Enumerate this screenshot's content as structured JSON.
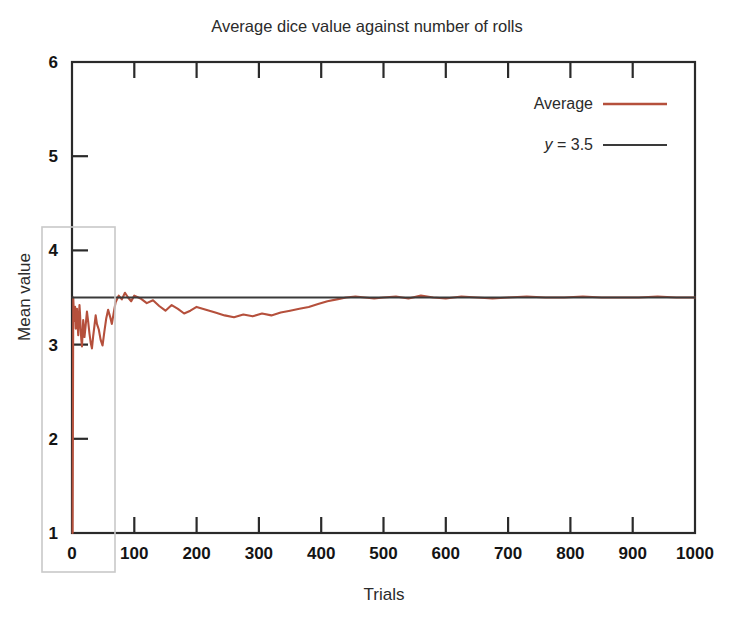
{
  "chart_data": {
    "type": "line",
    "title": "Average dice value against number of rolls",
    "xlabel": "Trials",
    "ylabel": "Mean value",
    "xlim": [
      0,
      1000
    ],
    "ylim": [
      1,
      6
    ],
    "xticks": [
      0,
      100,
      200,
      300,
      400,
      500,
      600,
      700,
      800,
      900,
      1000
    ],
    "xtick_labels": [
      "0",
      "100",
      "200",
      "300",
      "400",
      "500",
      "600",
      "700",
      "800",
      "900",
      "1000"
    ],
    "yticks": [
      1,
      2,
      3,
      4,
      5,
      6
    ],
    "ytick_labels": [
      "1",
      "2",
      "3",
      "4",
      "5",
      "6"
    ],
    "grid": false,
    "legend_position": "top-right",
    "series": [
      {
        "name": "Average",
        "kind": "line",
        "color": "#b5503c",
        "x": [
          1,
          2,
          3,
          4,
          5,
          6,
          7,
          8,
          9,
          10,
          11,
          12,
          13,
          14,
          15,
          16,
          17,
          18,
          19,
          20,
          22,
          24,
          26,
          28,
          30,
          32,
          34,
          36,
          38,
          40,
          43,
          46,
          49,
          52,
          55,
          58,
          61,
          64,
          67,
          70,
          75,
          80,
          85,
          90,
          95,
          100,
          110,
          120,
          130,
          140,
          150,
          160,
          170,
          180,
          190,
          200,
          215,
          230,
          245,
          260,
          275,
          290,
          305,
          320,
          335,
          350,
          365,
          380,
          395,
          410,
          425,
          440,
          455,
          470,
          485,
          500,
          520,
          540,
          560,
          580,
          600,
          625,
          650,
          675,
          700,
          730,
          760,
          790,
          820,
          850,
          880,
          910,
          940,
          970,
          1000
        ],
        "y": [
          1.0,
          3.5,
          3.33,
          3.25,
          3.4,
          3.17,
          3.29,
          3.38,
          3.22,
          3.1,
          3.27,
          3.42,
          3.31,
          3.15,
          3.05,
          2.98,
          3.12,
          3.26,
          3.18,
          3.08,
          3.21,
          3.35,
          3.24,
          3.12,
          3.02,
          2.96,
          3.09,
          3.2,
          3.31,
          3.22,
          3.16,
          3.05,
          2.99,
          3.14,
          3.28,
          3.37,
          3.3,
          3.22,
          3.34,
          3.45,
          3.52,
          3.48,
          3.55,
          3.5,
          3.46,
          3.52,
          3.49,
          3.44,
          3.47,
          3.41,
          3.36,
          3.42,
          3.38,
          3.33,
          3.36,
          3.4,
          3.37,
          3.34,
          3.31,
          3.29,
          3.32,
          3.3,
          3.33,
          3.31,
          3.34,
          3.36,
          3.38,
          3.4,
          3.43,
          3.46,
          3.48,
          3.5,
          3.51,
          3.5,
          3.49,
          3.5,
          3.51,
          3.49,
          3.52,
          3.5,
          3.49,
          3.51,
          3.5,
          3.49,
          3.5,
          3.51,
          3.5,
          3.5,
          3.51,
          3.5,
          3.5,
          3.5,
          3.51,
          3.5,
          3.5
        ]
      },
      {
        "name": "y = 3.5",
        "kind": "reference-line",
        "color": "#3a3a3a",
        "value": 3.5
      }
    ],
    "annotations": [
      {
        "name": "early-trials-highlight-box",
        "kind": "rectangle",
        "color": "#c9c9c9",
        "description": "highlight box around early trials region"
      }
    ]
  },
  "legend": {
    "entries": [
      {
        "label": "Average",
        "label_italic_prefix": "",
        "color": "#b5503c"
      },
      {
        "label": " = 3.5",
        "label_italic_prefix": "y",
        "color": "#3a3a3a"
      }
    ]
  }
}
